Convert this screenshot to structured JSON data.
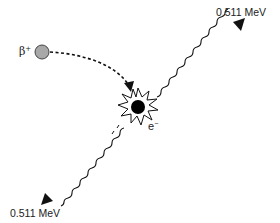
{
  "diagram": {
    "positron": {
      "symbol": "β",
      "charge": "+",
      "fill_color": "#a8a8a8"
    },
    "electron": {
      "symbol": "e",
      "charge": "−",
      "fill_color": "#000000"
    },
    "photons": [
      {
        "label": "0.511 MeV",
        "direction": "upper-right"
      },
      {
        "label": "0.511 MeV",
        "direction": "lower-left"
      }
    ],
    "colors": {
      "line": "#111111",
      "positron": "#a8a8a8",
      "electron": "#000000"
    }
  }
}
